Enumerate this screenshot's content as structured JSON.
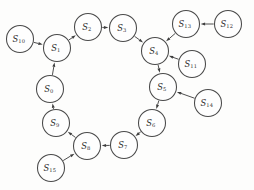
{
  "diagram": {
    "type": "state-transition-graph",
    "title": "",
    "background_color": "#fdfdfc",
    "node_fill": "#fefefe",
    "node_stroke": "#4a4a4a",
    "edge_color": "#4f4f4f",
    "node_radius": 13.5,
    "nodes": [
      {
        "id": "S0",
        "base": "S",
        "sub": "0",
        "label": "S0",
        "cx": 50,
        "cy": 89
      },
      {
        "id": "S1",
        "base": "S",
        "sub": "1",
        "label": "S1",
        "cx": 57,
        "cy": 48
      },
      {
        "id": "S2",
        "base": "S",
        "sub": "2",
        "label": "S2",
        "cx": 88,
        "cy": 27
      },
      {
        "id": "S3",
        "base": "S",
        "sub": "3",
        "label": "S3",
        "cx": 123,
        "cy": 28
      },
      {
        "id": "S4",
        "base": "S",
        "sub": "4",
        "label": "S4",
        "cx": 155,
        "cy": 51
      },
      {
        "id": "S5",
        "base": "S",
        "sub": "5",
        "label": "S5",
        "cx": 163,
        "cy": 87
      },
      {
        "id": "S6",
        "base": "S",
        "sub": "6",
        "label": "S6",
        "cx": 152,
        "cy": 123
      },
      {
        "id": "S7",
        "base": "S",
        "sub": "7",
        "label": "S7",
        "cx": 124,
        "cy": 145
      },
      {
        "id": "S8",
        "base": "S",
        "sub": "8",
        "label": "S8",
        "cx": 87,
        "cy": 146
      },
      {
        "id": "S9",
        "base": "S",
        "sub": "9",
        "label": "S9",
        "cx": 56,
        "cy": 123
      },
      {
        "id": "S10",
        "base": "S",
        "sub": "10",
        "label": "S10",
        "cx": 20,
        "cy": 39
      },
      {
        "id": "S11",
        "base": "S",
        "sub": "11",
        "label": "S11",
        "cx": 192,
        "cy": 64
      },
      {
        "id": "S12",
        "base": "S",
        "sub": "12",
        "label": "S12",
        "cx": 228,
        "cy": 24
      },
      {
        "id": "S13",
        "base": "S",
        "sub": "13",
        "label": "S13",
        "cx": 186,
        "cy": 24
      },
      {
        "id": "S14",
        "base": "S",
        "sub": "14",
        "label": "S14",
        "cx": 208,
        "cy": 103
      },
      {
        "id": "S15",
        "base": "S",
        "sub": "15",
        "label": "S15",
        "cx": 51,
        "cy": 168
      }
    ],
    "edges": [
      {
        "from": "S0",
        "to": "S1",
        "kind": "ring"
      },
      {
        "from": "S1",
        "to": "S2",
        "kind": "ring"
      },
      {
        "from": "S2",
        "to": "S3",
        "kind": "ring"
      },
      {
        "from": "S3",
        "to": "S4",
        "kind": "ring"
      },
      {
        "from": "S4",
        "to": "S5",
        "kind": "ring"
      },
      {
        "from": "S5",
        "to": "S6",
        "kind": "ring"
      },
      {
        "from": "S6",
        "to": "S7",
        "kind": "ring"
      },
      {
        "from": "S7",
        "to": "S8",
        "kind": "ring"
      },
      {
        "from": "S8",
        "to": "S9",
        "kind": "ring"
      },
      {
        "from": "S9",
        "to": "S0",
        "kind": "ring"
      },
      {
        "from": "S10",
        "to": "S1",
        "kind": "pendant"
      },
      {
        "from": "S11",
        "to": "S4",
        "kind": "pendant"
      },
      {
        "from": "S13",
        "to": "S4",
        "kind": "pendant"
      },
      {
        "from": "S12",
        "to": "S13",
        "kind": "pendant"
      },
      {
        "from": "S14",
        "to": "S5",
        "kind": "pendant"
      },
      {
        "from": "S15",
        "to": "S8",
        "kind": "pendant"
      }
    ]
  }
}
